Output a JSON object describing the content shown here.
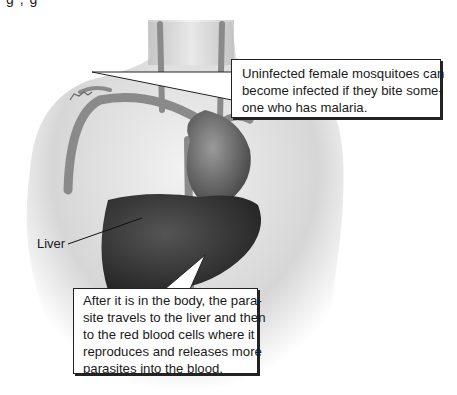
{
  "top_fragment": "g          ,            g",
  "figure": {
    "labels": {
      "liver": "Liver"
    },
    "callouts": [
      {
        "lines": [
          "Uninfected female mosquitoes can",
          "become infected if they bite some-",
          "one who has malaria."
        ]
      },
      {
        "lines": [
          "After it is in the body, the para-",
          "site travels to the liver and then",
          "to the red blood cells where it",
          "reproduces and releases more",
          "parasites into the blood."
        ]
      }
    ]
  },
  "colors": {
    "skin": "#d9d9d9",
    "vessel": "#8a8a8a",
    "heart": "#6e6e6e",
    "liver": "#3c3c3c",
    "callout_border": "#222222"
  }
}
